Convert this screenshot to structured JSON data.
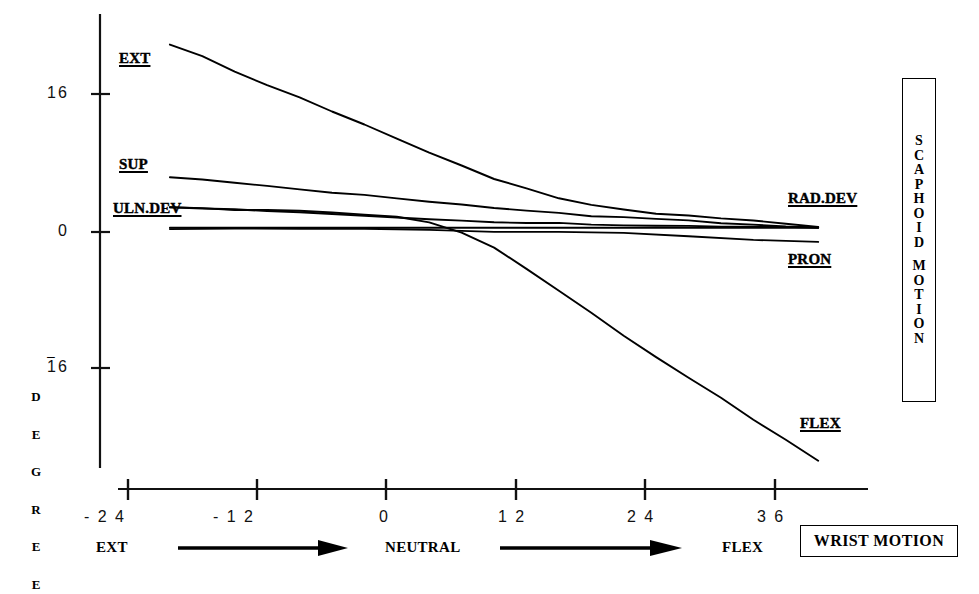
{
  "chart_data": {
    "type": "line",
    "title": "",
    "xlabel": "WRIST MOTION",
    "ylabel": "DEGREE",
    "xlim": [
      -24,
      42
    ],
    "ylim": [
      -30,
      24
    ],
    "xticks": [
      -24,
      -12,
      0,
      12,
      24,
      36
    ],
    "xticklabels": [
      "- 2 4",
      "- 1 2",
      "0",
      "1 2",
      "2 4",
      "3 6"
    ],
    "yticks": [
      16,
      0,
      -16
    ],
    "yticklabels": [
      "16",
      "0",
      "16"
    ],
    "grid": false,
    "legend_position": "inline-labels",
    "series": [
      {
        "name": "EXT",
        "x": [
          -20,
          -17,
          -14,
          -11,
          -8,
          -5,
          -2,
          1,
          4,
          7,
          10,
          13,
          16,
          19,
          22,
          25,
          28,
          31,
          34,
          37,
          40
        ],
        "values": [
          21.8,
          20.3,
          18.6,
          17.0,
          15.6,
          14.0,
          12.4,
          10.8,
          9.2,
          7.8,
          6.2,
          5.0,
          4.0,
          3.2,
          2.6,
          2.2,
          1.9,
          1.6,
          1.3,
          1.0,
          0.6
        ]
      },
      {
        "name": "SUP",
        "x": [
          -20,
          -17,
          -14,
          -11,
          -8,
          -5,
          -2,
          1,
          4,
          7,
          10,
          13,
          16,
          19,
          22,
          25,
          28,
          31,
          34,
          37,
          40
        ],
        "values": [
          6.4,
          6.1,
          5.7,
          5.3,
          5.0,
          4.6,
          4.3,
          3.9,
          3.5,
          3.1,
          2.8,
          2.5,
          2.2,
          1.9,
          1.7,
          1.5,
          1.3,
          1.1,
          0.9,
          0.7,
          0.6
        ]
      },
      {
        "name": "ULN.DEV",
        "x": [
          -20,
          -17,
          -14,
          -11,
          -8,
          -5,
          -2,
          1,
          4,
          7,
          10,
          13,
          16,
          19,
          22,
          25,
          28,
          31,
          34,
          37,
          40
        ],
        "values": [
          2.8,
          2.7,
          2.6,
          2.5,
          2.3,
          2.1,
          1.9,
          1.7,
          1.5,
          1.3,
          1.2,
          1.1,
          1.0,
          0.9,
          0.8,
          0.8,
          0.7,
          0.7,
          0.6,
          0.6,
          0.5
        ]
      },
      {
        "name": "RAD.DEV",
        "x": [
          -20,
          -10,
          0,
          10,
          20,
          30,
          40
        ],
        "values": [
          0.5,
          0.5,
          0.5,
          0.5,
          0.5,
          0.5,
          0.5
        ]
      },
      {
        "name": "PRON",
        "x": [
          -20,
          -14,
          -8,
          -2,
          4,
          10,
          16,
          22,
          28,
          34,
          40
        ],
        "values": [
          0.4,
          0.4,
          0.3,
          0.3,
          0.2,
          0.1,
          0.0,
          -0.2,
          -0.5,
          -0.9,
          -1.1
        ]
      },
      {
        "name": "FLEX",
        "x": [
          -20,
          -17,
          -14,
          -11,
          -8,
          -5,
          -2,
          1,
          4,
          7,
          10,
          13,
          16,
          19,
          22,
          25,
          28,
          31,
          34,
          37,
          40
        ],
        "values": [
          2.8,
          2.7,
          2.6,
          2.5,
          2.4,
          2.3,
          2.1,
          1.8,
          1.2,
          0.0,
          -1.8,
          -4.2,
          -6.8,
          -9.4,
          -12.0,
          -14.5,
          -16.9,
          -19.3,
          -21.7,
          -24.0,
          -26.5
        ]
      }
    ],
    "annotations": [
      {
        "name": "EXT",
        "text": "EXT"
      },
      {
        "name": "SUP",
        "text": "SUP"
      },
      {
        "name": "ULN.DEV",
        "text": "ULN.DEV"
      },
      {
        "name": "RAD.DEV",
        "text": "RAD.DEV"
      },
      {
        "name": "PRON",
        "text": "PRON"
      },
      {
        "name": "FLEX",
        "text": "FLEX"
      }
    ]
  },
  "labels": {
    "ext": "EXT",
    "sup": "SUP",
    "uln_dev": "ULN.DEV",
    "rad_dev": "RAD.DEV",
    "pron": "PRON",
    "flex": "FLEX"
  },
  "y_axis": {
    "label_letters": [
      "D",
      "E",
      "G",
      "R",
      "E",
      "E"
    ],
    "tick_top": "16",
    "tick_mid": "0",
    "tick_bottom": "16",
    "tick_bottom_minus": "–"
  },
  "x_axis": {
    "ticks": [
      "- 2 4",
      "- 1 2",
      "0",
      "1 2",
      "2 4",
      "3 6"
    ],
    "direction_left": "EXT",
    "direction_center": "NEUTRAL",
    "direction_right": "FLEX"
  },
  "boxes": {
    "scaphoid_line1": [
      "S",
      "C",
      "A",
      "P",
      "H",
      "O",
      "I",
      "D"
    ],
    "scaphoid_line2": [
      "M",
      "O",
      "T",
      "I",
      "O",
      "N"
    ],
    "wrist_motion": "WRIST MOTION"
  },
  "colors": {
    "ink": "#000000",
    "background": "#ffffff"
  }
}
